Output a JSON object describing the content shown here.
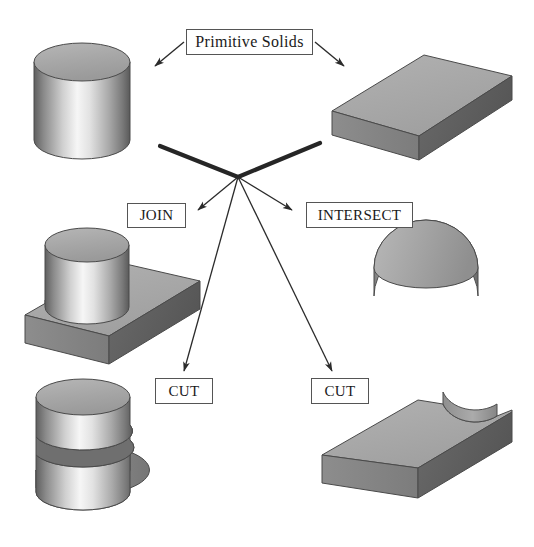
{
  "page": {
    "background_color": "#ffffff",
    "width": 534,
    "height": 547
  },
  "labels": {
    "primitive_solids": "Primitive Solids",
    "join": "JOIN",
    "intersect": "INTERSECT",
    "cut_left": "CUT",
    "cut_right": "CUT"
  },
  "colors": {
    "outline": "#3a3a3a",
    "box_border": "#555555",
    "text": "#1a1a1a",
    "solid_light": "#d8d8d8",
    "solid_mid": "#a8a8a8",
    "solid_dark": "#6e6e6e",
    "solid_darkest": "#4e4e4e",
    "highlight": "#f2f2f2",
    "background": "#ffffff"
  },
  "shapes": [
    {
      "name": "cylinder-primitive",
      "kind": "cylinder",
      "role": "primitive-input",
      "position": "top-left"
    },
    {
      "name": "box-primitive",
      "kind": "rectangular-slab",
      "role": "primitive-input",
      "position": "top-right"
    },
    {
      "name": "join-result",
      "kind": "cylinder-through-slab",
      "role": "boolean-union-result",
      "position": "middle-left"
    },
    {
      "name": "intersect-result",
      "kind": "half-cylinder",
      "role": "boolean-intersection-result",
      "position": "middle-right"
    },
    {
      "name": "cut-left-result",
      "kind": "cylinder-with-slot",
      "role": "boolean-difference-result",
      "position": "bottom-left"
    },
    {
      "name": "cut-right-result",
      "kind": "slab-with-circular-notch",
      "role": "boolean-difference-result",
      "position": "bottom-right"
    }
  ],
  "connectors": [
    {
      "name": "arrow-primitive-to-cylinder",
      "from": "primitive-solids-label",
      "to": "cylinder-primitive",
      "style": "thin-arrow"
    },
    {
      "name": "arrow-primitive-to-box",
      "from": "primitive-solids-label",
      "to": "box-primitive",
      "style": "thin-arrow"
    },
    {
      "name": "line-cylinder-to-hub",
      "from": "cylinder-primitive",
      "to": "operation-hub",
      "style": "thick-line"
    },
    {
      "name": "line-box-to-hub",
      "from": "box-primitive",
      "to": "operation-hub",
      "style": "thick-line"
    },
    {
      "name": "arrow-hub-to-join",
      "from": "operation-hub",
      "to": "join-label",
      "style": "thin-arrow"
    },
    {
      "name": "arrow-hub-to-intersect",
      "from": "operation-hub",
      "to": "intersect-label",
      "style": "thin-arrow"
    },
    {
      "name": "arrow-hub-to-cut-left",
      "from": "operation-hub",
      "to": "cut-left-label",
      "style": "thin-arrow"
    },
    {
      "name": "arrow-hub-to-cut-right",
      "from": "operation-hub",
      "to": "cut-right-label",
      "style": "thin-arrow"
    }
  ]
}
